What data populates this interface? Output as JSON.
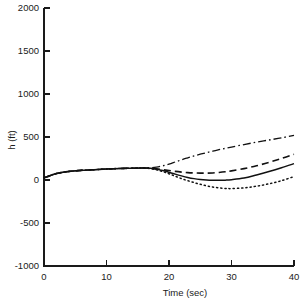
{
  "chart_data": {
    "type": "line",
    "title": "",
    "xlabel": "Time (sec)",
    "ylabel": "h (ft)",
    "xlim": [
      0,
      40
    ],
    "ylim": [
      -1000,
      2000
    ],
    "xticks": [
      0,
      10,
      20,
      30,
      40
    ],
    "yticks": [
      -1000,
      -500,
      0,
      500,
      1000,
      1500,
      2000
    ],
    "xtick_labels": [
      "0",
      "10",
      "20",
      "30",
      "40"
    ],
    "ytick_labels": [
      "-1000",
      "-500",
      "0",
      "500",
      "1000",
      "1500",
      "2000"
    ],
    "grid": false,
    "legend": null,
    "legend_position": "none",
    "x": [
      0,
      2,
      4,
      6,
      8,
      10,
      12,
      14,
      16,
      17,
      18,
      19,
      20,
      21,
      22,
      23,
      24,
      25,
      26,
      27,
      28,
      29,
      30,
      32,
      34,
      36,
      38,
      40
    ],
    "series": [
      {
        "name": "dash-dot",
        "style": "dashdot",
        "values": [
          25,
          75,
          100,
          112,
          120,
          128,
          133,
          137,
          140,
          142,
          150,
          165,
          185,
          210,
          235,
          258,
          280,
          300,
          318,
          335,
          352,
          368,
          383,
          412,
          440,
          465,
          490,
          520
        ]
      },
      {
        "name": "dashed",
        "style": "dashed",
        "values": [
          25,
          75,
          100,
          112,
          120,
          128,
          133,
          137,
          140,
          138,
          130,
          120,
          110,
          100,
          92,
          86,
          82,
          80,
          80,
          82,
          88,
          96,
          106,
          132,
          165,
          205,
          250,
          300
        ]
      },
      {
        "name": "solid",
        "style": "solid",
        "values": [
          25,
          75,
          100,
          112,
          120,
          128,
          133,
          137,
          140,
          136,
          125,
          110,
          90,
          68,
          48,
          30,
          16,
          6,
          0,
          -3,
          -4,
          -2,
          3,
          22,
          58,
          98,
          142,
          190
        ]
      },
      {
        "name": "dotted",
        "style": "dotted",
        "values": [
          25,
          75,
          100,
          112,
          120,
          128,
          133,
          137,
          138,
          132,
          118,
          98,
          72,
          44,
          16,
          -8,
          -30,
          -50,
          -68,
          -82,
          -92,
          -98,
          -100,
          -92,
          -72,
          -44,
          -8,
          40
        ]
      }
    ]
  },
  "axes": {
    "y_axis_label": "h (ft)",
    "x_axis_label": "Time (sec)"
  }
}
